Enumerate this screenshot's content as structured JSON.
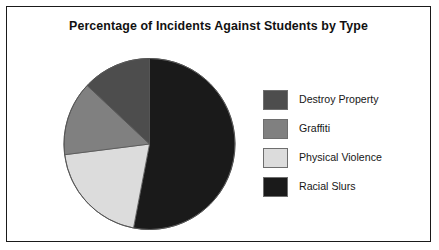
{
  "chart": {
    "title": "Percentage of Incidents Against Students by Type"
  },
  "legend": {
    "items": [
      {
        "label": "Destroy Property",
        "color": "#4d4d4d",
        "swatch_name": "legend-swatch-destroy-property"
      },
      {
        "label": "Graffiti",
        "color": "#808080",
        "swatch_name": "legend-swatch-graffiti"
      },
      {
        "label": "Physical Violence",
        "color": "#dcdcdc",
        "swatch_name": "legend-swatch-physical-violence"
      },
      {
        "label": "Racial Slurs",
        "color": "#1a1a1a",
        "swatch_name": "legend-swatch-racial-slurs"
      }
    ]
  },
  "chart_data": {
    "type": "pie",
    "title": "Percentage of Incidents Against Students by Type",
    "xlabel": "",
    "ylabel": "",
    "legend_position": "right",
    "grid": false,
    "start_angle_deg": 0,
    "direction": "clockwise",
    "categories": [
      "Racial Slurs",
      "Physical Violence",
      "Graffiti",
      "Destroy Property"
    ],
    "values": [
      53,
      20,
      14,
      13
    ],
    "unit": "percent",
    "slices": [
      {
        "label": "Racial Slurs",
        "value": 53,
        "color": "#1a1a1a",
        "start_deg": 0,
        "end_deg": 190.8
      },
      {
        "label": "Physical Violence",
        "value": 20,
        "color": "#dcdcdc",
        "start_deg": 190.8,
        "end_deg": 262.8
      },
      {
        "label": "Graffiti",
        "value": 14,
        "color": "#808080",
        "start_deg": 262.8,
        "end_deg": 313.2
      },
      {
        "label": "Destroy Property",
        "value": 13,
        "color": "#4d4d4d",
        "start_deg": 313.2,
        "end_deg": 360
      }
    ]
  },
  "style": {
    "frame_border_color": "#1a1a1a",
    "background": "#ffffff",
    "pie_outline_color": "#555555",
    "title_color": "#111111"
  }
}
